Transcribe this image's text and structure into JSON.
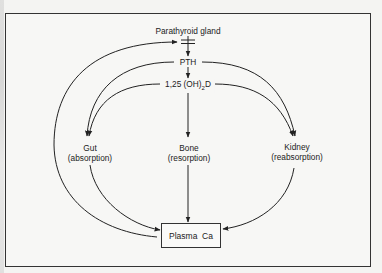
{
  "diagram": {
    "nodes": {
      "parathyroid": {
        "label": "Parathyroid gland"
      },
      "pth": {
        "label": "PTH"
      },
      "vitd_prefix": "1,25 (OH)",
      "vitd_sub": "2",
      "vitd_suffix": "D",
      "gut": {
        "label": "Gut",
        "sublabel": "(absorption)"
      },
      "bone": {
        "label": "Bone",
        "sublabel": "(resorption)"
      },
      "kidney": {
        "label": "Kidney",
        "sublabel": "(reabsorption)"
      },
      "plasma": {
        "label": "Plasma  Ca"
      }
    },
    "edges": [
      {
        "from": "parathyroid",
        "to": "pth",
        "type": "stimulate"
      },
      {
        "from": "pth",
        "to": "vitd",
        "type": "stimulate"
      },
      {
        "from": "pth",
        "to": "gut",
        "type": "stimulate"
      },
      {
        "from": "pth",
        "to": "kidney",
        "type": "stimulate"
      },
      {
        "from": "vitd",
        "to": "gut",
        "type": "stimulate"
      },
      {
        "from": "vitd",
        "to": "bone",
        "type": "stimulate"
      },
      {
        "from": "vitd",
        "to": "kidney",
        "type": "stimulate"
      },
      {
        "from": "gut",
        "to": "plasma",
        "type": "stimulate"
      },
      {
        "from": "bone",
        "to": "plasma",
        "type": "stimulate"
      },
      {
        "from": "kidney",
        "to": "plasma",
        "type": "stimulate"
      },
      {
        "from": "plasma",
        "to": "parathyroid",
        "type": "inhibit"
      }
    ],
    "colors": {
      "line": "#222222",
      "background": "#f7f7f5"
    }
  }
}
